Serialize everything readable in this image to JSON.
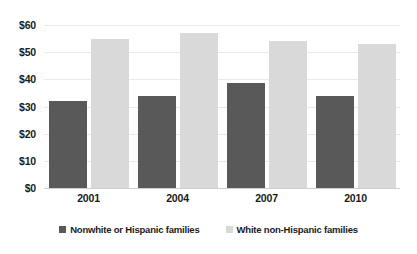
{
  "chart_data": {
    "type": "bar",
    "title": "",
    "xlabel": "",
    "ylabel": "",
    "categories": [
      "2001",
      "2004",
      "2007",
      "2010"
    ],
    "series": [
      {
        "name": "Nonwhite or Hispanic families",
        "color": "#595959",
        "values": [
          32,
          34,
          38.5,
          34
        ]
      },
      {
        "name": "White non-Hispanic families",
        "color": "#d9d9d9",
        "values": [
          55,
          57,
          54,
          53
        ]
      }
    ],
    "ylim": [
      0,
      60
    ],
    "yticks": [
      0,
      10,
      20,
      30,
      40,
      50,
      60
    ],
    "ytick_labels": [
      "$0",
      "$10",
      "$20",
      "$30",
      "$40",
      "$50",
      "$60"
    ],
    "grid": true,
    "legend_position": "bottom"
  },
  "legend": {
    "items": [
      {
        "label": "Nonwhite or Hispanic families"
      },
      {
        "label": "White non-Hispanic families"
      }
    ]
  }
}
